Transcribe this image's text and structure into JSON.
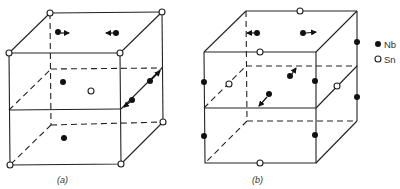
{
  "figure": {
    "panels": [
      {
        "id": "a",
        "label": "(a)"
      },
      {
        "id": "b",
        "label": "(b)"
      }
    ],
    "legend": [
      {
        "symbol": "filled-circle",
        "label": "Nb"
      },
      {
        "symbol": "open-circle",
        "label": "Sn"
      }
    ],
    "colors": {
      "line": "#222222",
      "nb": "#111111",
      "sn": "#ffffff"
    }
  }
}
